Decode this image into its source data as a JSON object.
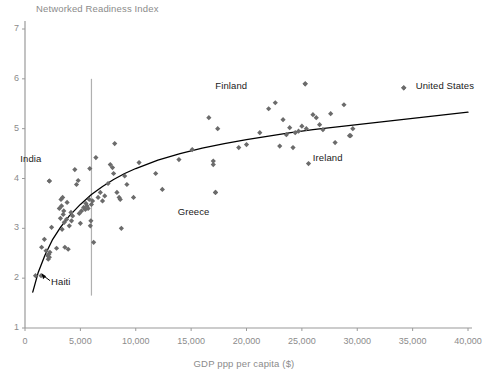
{
  "chart_data": {
    "type": "scatter",
    "title": "",
    "ylabel": "Networked Readiness Index",
    "xlabel": "GDP ppp per capita ($)",
    "xlim": [
      0,
      40000
    ],
    "ylim": [
      1,
      7
    ],
    "grid": false,
    "legend": "none",
    "y_ticks": [
      "1",
      "2",
      "3",
      "4",
      "5",
      "6",
      "7"
    ],
    "y_tick_values": [
      1,
      2,
      3,
      4,
      5,
      6,
      7
    ],
    "x_ticks": [
      "0",
      "5,000",
      "10,000",
      "15,000",
      "20,000",
      "25,000",
      "30,000",
      "35,000",
      "40,000"
    ],
    "x_tick_values": [
      0,
      5000,
      10000,
      15000,
      20000,
      25000,
      30000,
      35000,
      40000
    ],
    "marker": "diamond",
    "marker_color": "#6b6b6b",
    "trend_color": "#000000",
    "axis_color": "#9a9a9a",
    "reference_line": {
      "x": 6000,
      "color": "#b0b0b0",
      "y_from": 1.65,
      "y_to": 6.0
    },
    "annotations": [
      {
        "label": "India",
        "x": 2200,
        "y": 3.95,
        "label_dx": -8,
        "label_dy": -22
      },
      {
        "label": "Haiti",
        "x": 1450,
        "y": 2.05,
        "label_dx": 10,
        "label_dy": 6
      },
      {
        "label": "Greece",
        "x": 17200,
        "y": 3.72,
        "label_dx": -6,
        "label_dy": 20
      },
      {
        "label": "Finland",
        "x": 25300,
        "y": 5.9,
        "label_dx": -58,
        "label_dy": 2
      },
      {
        "label": "Ireland",
        "x": 29400,
        "y": 4.86,
        "label_dx": -8,
        "label_dy": 22
      },
      {
        "label": "United States",
        "x": 34200,
        "y": 5.82,
        "label_dx": 12,
        "label_dy": -2
      }
    ],
    "points": [
      [
        950,
        2.05
      ],
      [
        1500,
        2.62
      ],
      [
        1750,
        2.78
      ],
      [
        1900,
        2.55
      ],
      [
        2050,
        2.45
      ],
      [
        2100,
        2.38
      ],
      [
        2150,
        2.48
      ],
      [
        2200,
        2.42
      ],
      [
        2200,
        3.95
      ],
      [
        2250,
        2.52
      ],
      [
        2400,
        3.02
      ],
      [
        2850,
        2.6
      ],
      [
        3100,
        3.4
      ],
      [
        3200,
        3.2
      ],
      [
        3250,
        3.58
      ],
      [
        3300,
        3.45
      ],
      [
        3350,
        2.98
      ],
      [
        3400,
        3.62
      ],
      [
        3450,
        3.28
      ],
      [
        3500,
        3.35
      ],
      [
        3550,
        3.12
      ],
      [
        3600,
        2.62
      ],
      [
        3750,
        3.18
      ],
      [
        3800,
        3.52
      ],
      [
        3900,
        2.58
      ],
      [
        4000,
        3.05
      ],
      [
        4150,
        3.32
      ],
      [
        4200,
        3.15
      ],
      [
        4300,
        3.25
      ],
      [
        4500,
        4.18
      ],
      [
        4650,
        3.88
      ],
      [
        4800,
        3.96
      ],
      [
        4900,
        3.3
      ],
      [
        5000,
        3.1
      ],
      [
        5100,
        3.35
      ],
      [
        5300,
        3.42
      ],
      [
        5450,
        3.38
      ],
      [
        5500,
        3.5
      ],
      [
        5600,
        3.45
      ],
      [
        5700,
        3.4
      ],
      [
        5800,
        3.58
      ],
      [
        5850,
        4.2
      ],
      [
        5900,
        3.05
      ],
      [
        5950,
        3.15
      ],
      [
        6000,
        3.48
      ],
      [
        6100,
        3.55
      ],
      [
        6200,
        2.72
      ],
      [
        6400,
        4.42
      ],
      [
        6600,
        3.62
      ],
      [
        6800,
        3.72
      ],
      [
        7000,
        3.55
      ],
      [
        7200,
        3.65
      ],
      [
        7500,
        3.9
      ],
      [
        7700,
        4.28
      ],
      [
        7900,
        4.22
      ],
      [
        8000,
        4.1
      ],
      [
        8100,
        4.7
      ],
      [
        8300,
        3.72
      ],
      [
        8500,
        3.62
      ],
      [
        8600,
        3.58
      ],
      [
        8700,
        3.0
      ],
      [
        9000,
        4.05
      ],
      [
        9200,
        3.88
      ],
      [
        9800,
        3.62
      ],
      [
        10300,
        4.32
      ],
      [
        11800,
        4.1
      ],
      [
        12400,
        3.78
      ],
      [
        13900,
        4.38
      ],
      [
        15100,
        4.58
      ],
      [
        16600,
        5.22
      ],
      [
        17000,
        4.35
      ],
      [
        17000,
        4.28
      ],
      [
        17200,
        3.72
      ],
      [
        17400,
        5.0
      ],
      [
        19300,
        4.62
      ],
      [
        20000,
        4.68
      ],
      [
        21200,
        4.92
      ],
      [
        22000,
        5.4
      ],
      [
        22600,
        5.52
      ],
      [
        23000,
        4.65
      ],
      [
        23300,
        5.18
      ],
      [
        23600,
        4.88
      ],
      [
        23900,
        5.02
      ],
      [
        24200,
        4.62
      ],
      [
        24400,
        4.92
      ],
      [
        24700,
        4.95
      ],
      [
        25000,
        5.05
      ],
      [
        25300,
        5.9
      ],
      [
        25400,
        5.0
      ],
      [
        25600,
        4.3
      ],
      [
        26000,
        5.28
      ],
      [
        26300,
        5.22
      ],
      [
        26600,
        5.08
      ],
      [
        26900,
        4.98
      ],
      [
        27600,
        5.3
      ],
      [
        28000,
        4.72
      ],
      [
        28800,
        5.48
      ],
      [
        29300,
        4.86
      ],
      [
        29600,
        5.0
      ],
      [
        34200,
        5.82
      ]
    ],
    "trend_curve": [
      [
        700,
        1.72
      ],
      [
        1200,
        2.12
      ],
      [
        1800,
        2.46
      ],
      [
        2500,
        2.78
      ],
      [
        3200,
        3.02
      ],
      [
        4000,
        3.25
      ],
      [
        5000,
        3.48
      ],
      [
        6000,
        3.68
      ],
      [
        7000,
        3.84
      ],
      [
        8000,
        3.98
      ],
      [
        9000,
        4.1
      ],
      [
        10000,
        4.2
      ],
      [
        12000,
        4.37
      ],
      [
        14000,
        4.5
      ],
      [
        16000,
        4.61
      ],
      [
        18000,
        4.7
      ],
      [
        20000,
        4.78
      ],
      [
        22000,
        4.85
      ],
      [
        24000,
        4.92
      ],
      [
        26000,
        4.98
      ],
      [
        28000,
        5.03
      ],
      [
        30000,
        5.08
      ],
      [
        32000,
        5.13
      ],
      [
        34000,
        5.18
      ],
      [
        36000,
        5.23
      ],
      [
        38000,
        5.28
      ],
      [
        40000,
        5.33
      ]
    ]
  }
}
